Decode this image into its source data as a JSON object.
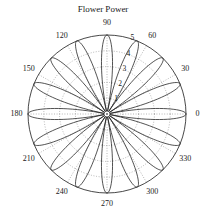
{
  "figure": {
    "width": 206,
    "height": 217,
    "background_color": "#ffffff"
  },
  "chart_data": {
    "type": "line",
    "subtype": "polar-rose",
    "title": "Flower Power",
    "xlabel": "",
    "ylabel": "",
    "grid": true,
    "legend": null,
    "legend_position": "none",
    "colors": {
      "curve": "#1a1a1a",
      "grid": "#6e6e6e",
      "axis": "#1a1a1a",
      "text": "#1a1a1a",
      "background": "#ffffff"
    },
    "polar": {
      "center_px": [
        107,
        114
      ],
      "outer_radius_px": 79,
      "theta_direction": "counterclockwise",
      "theta_zero_location": "E",
      "rlim": [
        0,
        5
      ],
      "rticks": [
        1,
        2,
        3,
        4,
        5
      ],
      "rtick_labels": [
        "1",
        "2",
        "3",
        "4",
        "5"
      ],
      "rtick_label_angle_deg": 75,
      "theta_ticks_deg": [
        0,
        30,
        60,
        90,
        120,
        150,
        180,
        210,
        240,
        270,
        300,
        330
      ],
      "theta_tick_labels": [
        "0",
        "30",
        "60",
        "90",
        "120",
        "150",
        "180",
        "210",
        "240",
        "270",
        "300",
        "330"
      ]
    },
    "equation": "r = 5 * |cos(8 * theta)|",
    "petal_count": 16,
    "petal_peak_r": 5,
    "petal_peak_angles_deg": [
      0,
      22.5,
      45,
      67.5,
      90,
      112.5,
      135,
      157.5,
      180,
      202.5,
      225,
      247.5,
      270,
      292.5,
      315,
      337.5
    ],
    "samples": 721,
    "series": [
      {
        "name": "rose",
        "values": [
          5,
          5
        ]
      }
    ]
  }
}
